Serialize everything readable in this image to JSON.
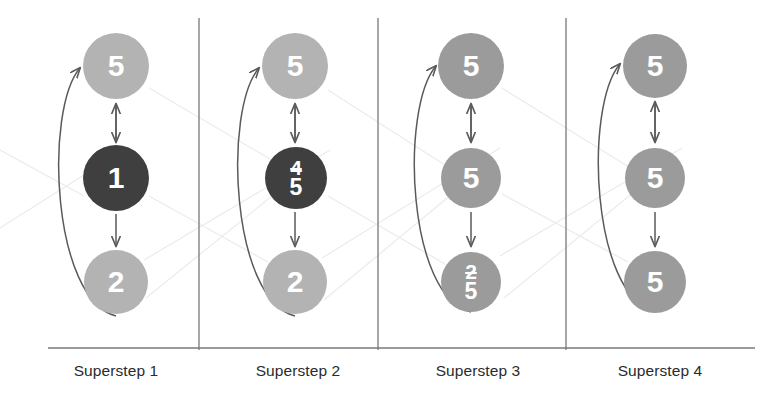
{
  "figure": {
    "type": "diagram",
    "background": "#ffffff"
  },
  "colors": {
    "node_light": "#b3b3b3",
    "node_medium": "#9b9b9b",
    "node_dark": "#3f3f3f",
    "node_text": "#ffffff",
    "arrow": "#5a5a5a",
    "divider": "#8a8a8a",
    "baseline": "#7a7a7a",
    "faint_link": "#e9e9e9",
    "label_text": "#2b2b2b"
  },
  "columns": [
    {
      "id": "superstep-1",
      "label": "Superstep 1",
      "label_left": 21,
      "center_x": 116,
      "nodes": [
        {
          "pos": "top",
          "cx": 116,
          "cy": 66,
          "r": 33,
          "tone": "node_light",
          "value": "5",
          "display": "single"
        },
        {
          "pos": "middle",
          "cx": 116,
          "cy": 178,
          "r": 33,
          "tone": "node_dark",
          "value": "1",
          "display": "single"
        },
        {
          "pos": "bottom",
          "cx": 116,
          "cy": 282,
          "r": 32,
          "tone": "node_light",
          "value": "2",
          "display": "single"
        }
      ]
    },
    {
      "id": "superstep-2",
      "label": "Superstep 2",
      "label_left": 203,
      "center_x": 295,
      "nodes": [
        {
          "pos": "top",
          "cx": 295,
          "cy": 66,
          "r": 33,
          "tone": "node_light",
          "value": "5",
          "display": "single"
        },
        {
          "pos": "middle",
          "cx": 296,
          "cy": 178,
          "r": 31,
          "tone": "node_dark",
          "old_value": "4",
          "value": "5",
          "display": "stacked"
        },
        {
          "pos": "bottom",
          "cx": 295,
          "cy": 282,
          "r": 32,
          "tone": "node_light",
          "value": "2",
          "display": "single"
        }
      ]
    },
    {
      "id": "superstep-3",
      "label": "Superstep 3",
      "label_left": 383,
      "center_x": 471,
      "nodes": [
        {
          "pos": "top",
          "cx": 471,
          "cy": 66,
          "r": 33,
          "tone": "node_medium",
          "value": "5",
          "display": "single"
        },
        {
          "pos": "middle",
          "cx": 471,
          "cy": 178,
          "r": 30,
          "tone": "node_medium",
          "value": "5",
          "display": "single"
        },
        {
          "pos": "bottom",
          "cx": 471,
          "cy": 282,
          "r": 30,
          "tone": "node_medium",
          "old_value": "2",
          "value": "5",
          "display": "stacked"
        }
      ]
    },
    {
      "id": "superstep-4",
      "label": "Superstep 4",
      "label_left": 565,
      "center_x": 655,
      "nodes": [
        {
          "pos": "top",
          "cx": 655,
          "cy": 66,
          "r": 32,
          "tone": "node_medium",
          "value": "5",
          "display": "single"
        },
        {
          "pos": "middle",
          "cx": 655,
          "cy": 178,
          "r": 30,
          "tone": "node_medium",
          "value": "5",
          "display": "single"
        },
        {
          "pos": "bottom",
          "cx": 655,
          "cy": 282,
          "r": 31,
          "tone": "node_medium",
          "value": "5",
          "display": "single"
        }
      ]
    }
  ],
  "dividers": [
    {
      "x": 199,
      "y1": 18,
      "y2": 350
    },
    {
      "x": 378,
      "y1": 18,
      "y2": 350
    },
    {
      "x": 566,
      "y1": 18,
      "y2": 350
    }
  ],
  "baseline": {
    "x1": 48,
    "x2": 755,
    "y": 348
  },
  "edges": {
    "top_middle_bidirectional": "double-headed vertical arrow between top and middle node",
    "middle_bottom_downward": "single-headed downward arrow from middle to bottom node",
    "bottom_to_top_curve": "curved arrow bulging left from bottom node up to top node"
  }
}
